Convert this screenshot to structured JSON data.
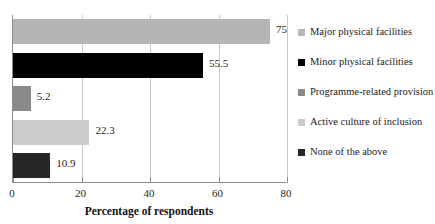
{
  "chart_data": {
    "type": "bar",
    "orientation": "horizontal",
    "title": "",
    "xlabel": "Percentage of respondents",
    "ylabel": "",
    "xlim": [
      0,
      80
    ],
    "xticks": [
      0,
      20,
      40,
      60,
      80
    ],
    "xtick_labels": [
      "0",
      "20",
      "40",
      "60",
      "80"
    ],
    "grid": true,
    "legend_position": "right",
    "categories": [
      "Major physical facilities",
      "Minor physical facilities",
      "Programme-related provision",
      "Active culture of inclusion",
      "None of the above"
    ],
    "values": [
      75,
      55.5,
      5.2,
      22.3,
      10.9
    ],
    "value_labels": [
      "75",
      "55.5",
      "5.2",
      "22.3",
      "10.9"
    ],
    "colors": [
      "#b5b5b5",
      "#000000",
      "#8a8a8a",
      "#cccccc",
      "#262626"
    ]
  },
  "legend": {
    "items": [
      {
        "label": "Major physical facilities",
        "color": "#b5b5b5"
      },
      {
        "label": "Minor physical facilities",
        "color": "#000000"
      },
      {
        "label": "Programme-related provision",
        "color": "#8a8a8a"
      },
      {
        "label": "Active culture of inclusion",
        "color": "#cccccc"
      },
      {
        "label": "None of the above",
        "color": "#262626"
      }
    ]
  },
  "axis": {
    "x_title": "Percentage of respondents",
    "tick_labels": [
      "0",
      "20",
      "40",
      "60",
      "80"
    ]
  }
}
